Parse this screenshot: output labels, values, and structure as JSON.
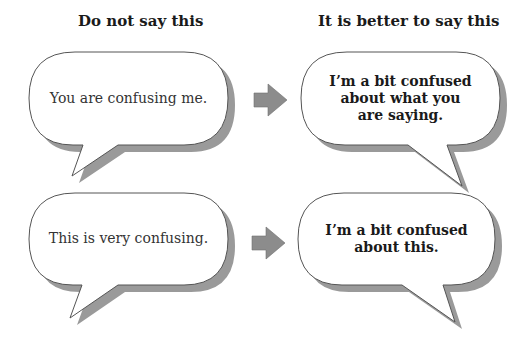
{
  "headings": {
    "left": "Do not say this",
    "right": "It is better to say this"
  },
  "rows": [
    {
      "avoid": "You are confusing me.",
      "better": "I’m a bit confused about what you are saying.",
      "better_lines": [
        "I’m a bit confused",
        "about what you",
        "are saying."
      ]
    },
    {
      "avoid": "This is very confusing.",
      "better": "I’m a bit confused about this.",
      "better_lines": [
        "I’m a bit confused",
        "about this."
      ]
    }
  ],
  "icons": {
    "transition_arrow": "right-arrow-icon"
  },
  "colors": {
    "bubble_fill": "#ffffff",
    "bubble_stroke": "#555555",
    "shadow": "#9a9a9a",
    "arrow": "#8c8c8c",
    "text": "#1a1a1a"
  }
}
